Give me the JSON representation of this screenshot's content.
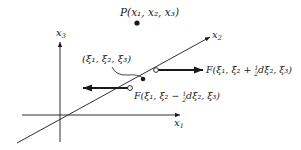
{
  "figure": {
    "colors": {
      "line": "#1a1a1a",
      "background": "#ffffff"
    }
  },
  "axes": {
    "x1": {
      "label_base": "x",
      "label_sub": "1"
    },
    "x2": {
      "label_base": "x",
      "label_sub": "2"
    },
    "x3": {
      "label_base": "x",
      "label_sub": "3"
    }
  },
  "point_p": {
    "label": "P(x₁, x₂, x₃)"
  },
  "material_point": {
    "label": "(ξ₁,  ξ₂,  ξ₃)"
  },
  "forces": {
    "positive": {
      "label_prefix": "F(ξ₁,  ξ₂ + ",
      "frac_num": "1",
      "frac_den": "2",
      "label_suffix": "dξ₂,  ξ₃)",
      "direction": "right"
    },
    "negative": {
      "label_prefix": "F(ξ₁,  ξ₂ − ",
      "frac_num": "1",
      "frac_den": "2",
      "label_suffix": "dξ₂,  ξ₃)",
      "direction": "left"
    }
  }
}
